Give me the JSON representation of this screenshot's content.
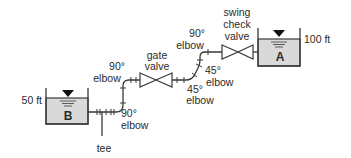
{
  "diagram": {
    "type": "pipe-network",
    "tanks": [
      {
        "id": "B",
        "letter": "B",
        "elevation_label": "50 ft",
        "fill_color": "#d9d9d9"
      },
      {
        "id": "A",
        "letter": "A",
        "elevation_label": "100 ft",
        "fill_color": "#d9d9d9"
      }
    ],
    "fittings": {
      "tee": {
        "label": "tee"
      },
      "elbow_90_lower": {
        "line1": "90°",
        "line2": "elbow"
      },
      "elbow_90_upper_left": {
        "line1": "90°",
        "line2": "elbow"
      },
      "gate_valve": {
        "line1": "gate",
        "line2": "valve"
      },
      "elbow_45_lower": {
        "line1": "45°",
        "line2": "elbow"
      },
      "elbow_45_upper": {
        "line1": "45°",
        "line2": "elbow"
      },
      "elbow_90_upper_right": {
        "line1": "90°",
        "line2": "elbow"
      },
      "swing_check_valve": {
        "line1": "swing",
        "line2": "check",
        "line3": "valve"
      }
    },
    "colors": {
      "line": "#3a3a3a",
      "water": "#d9d9d9",
      "text": "#2a2a2a",
      "background": "#ffffff"
    }
  }
}
